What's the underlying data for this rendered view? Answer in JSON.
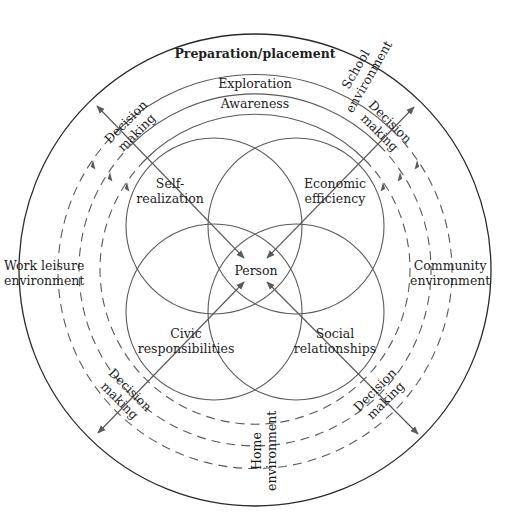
{
  "diagram": {
    "title": "Preparation/placement",
    "rings": [
      {
        "label": "Exploration"
      },
      {
        "label": "Awareness"
      }
    ],
    "center_label": "Person",
    "domains": {
      "top_left": [
        "Self-",
        "realization"
      ],
      "top_right": [
        "Economic",
        "efficiency"
      ],
      "bottom_left": [
        "Civic",
        "responsibilities"
      ],
      "bottom_right": [
        "Social",
        "relationships"
      ]
    },
    "environments": {
      "school": [
        "School",
        "environment"
      ],
      "work_leisure": [
        "Work leisure",
        "environment"
      ],
      "community": [
        "Community",
        "environment"
      ],
      "home": [
        "Home",
        "environment"
      ]
    },
    "decision_making": {
      "top_left": [
        "Decision",
        "making"
      ],
      "top_right": [
        "Decision",
        "making"
      ],
      "bottom_left": [
        "Decision",
        "making"
      ],
      "bottom_right": [
        "Decision",
        "making"
      ]
    },
    "colors": {
      "line": "#5a5a5a",
      "outer_line": "#2a2a2a",
      "text": "#1e1e1e",
      "background": "#ffffff"
    }
  }
}
